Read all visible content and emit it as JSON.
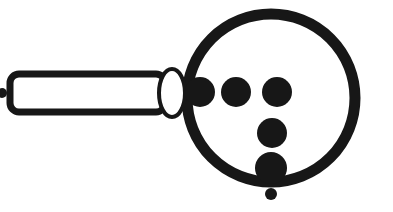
{
  "image": {
    "kind": "line-art-illustration",
    "subject": "magnifying-glass-with-dots",
    "title": "Magnifying glass",
    "width": 393,
    "height": 212,
    "background_color": "#ffffff",
    "ink_color": "#171717"
  },
  "lens": {
    "label": "lens-ring",
    "center_x": 271,
    "center_y": 98,
    "radius": 84,
    "stroke_width": 11,
    "fill": "none",
    "color": "#171717"
  },
  "collar": {
    "label": "lens-collar-ellipse",
    "center_x": 172,
    "center_y": 93,
    "radius_x": 13,
    "radius_y": 24,
    "stroke_width": 4,
    "fill": "#ffffff",
    "color": "#171717"
  },
  "handle": {
    "label": "handle-bar",
    "x": 10,
    "y": 74,
    "width": 155,
    "height": 38,
    "corner_radius": 9,
    "stroke_width": 7,
    "fill": "#ffffff",
    "color": "#171717"
  },
  "handle_tip_dot": {
    "label": "handle-tip-dot",
    "center_x": 2,
    "center_y": 93,
    "radius": 5,
    "color": "#171717"
  },
  "dots": [
    {
      "name": "dot-inner-left",
      "cx": 200,
      "cy": 92,
      "r": 15,
      "color": "#171717"
    },
    {
      "name": "dot-inner-middle",
      "cx": 236,
      "cy": 92,
      "r": 15,
      "color": "#171717"
    },
    {
      "name": "dot-inner-right",
      "cx": 277,
      "cy": 92,
      "r": 15,
      "color": "#171717"
    },
    {
      "name": "dot-center-lower",
      "cx": 272,
      "cy": 133,
      "r": 15,
      "color": "#171717"
    },
    {
      "name": "dot-bottom-rim",
      "cx": 271,
      "cy": 168,
      "r": 16,
      "color": "#171717"
    },
    {
      "name": "dot-below-rim",
      "cx": 271,
      "cy": 194,
      "r": 6,
      "color": "#171717"
    }
  ],
  "counts": {
    "total_dots": 6,
    "large_dots": 5,
    "small_dots": 1
  },
  "alt_text": "Black and white line drawing of a magnifying glass angled to the left, its round lens ring holding five filled dots with one small dot just beneath the bottom rim."
}
